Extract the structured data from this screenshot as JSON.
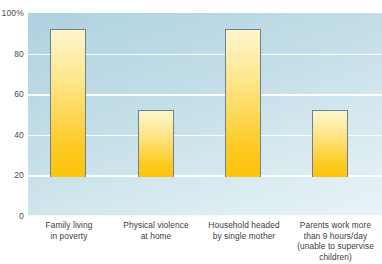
{
  "chart_data": {
    "type": "bar",
    "title": "",
    "xlabel": "",
    "ylabel": "",
    "ylim": [
      0,
      100
    ],
    "grid": true,
    "legend": "none",
    "categories": [
      "Family living in poverty",
      "Physical violence at home",
      "Household headed by single mother",
      "Parents work more than 9 hours/day (unable to supervise children)"
    ],
    "category_lines": [
      [
        "Family living",
        "in poverty"
      ],
      [
        "Physical violence",
        "at home"
      ],
      [
        "Household headed",
        "by single mother"
      ],
      [
        "Parents work more",
        "than 9 hours/day",
        "(unable to supervise",
        "children)"
      ]
    ],
    "values": [
      83,
      81,
      73,
      33
    ],
    "y_ticks": [
      "100%",
      "80",
      "60",
      "40",
      "20",
      "0"
    ],
    "y_tick_values": [
      100,
      80,
      60,
      40,
      20,
      0
    ],
    "colors": {
      "bar_top": "#fdf6cc",
      "bar_bottom": "#fcc40a",
      "bar_border": "#6e7f8f",
      "plot_bg_top": "#aed2e0",
      "plot_bg_bottom": "#e8f4f7",
      "gridline": "#ffffff",
      "tick_text": "#4a4a4a",
      "label_text": "#3b3b3b"
    }
  }
}
